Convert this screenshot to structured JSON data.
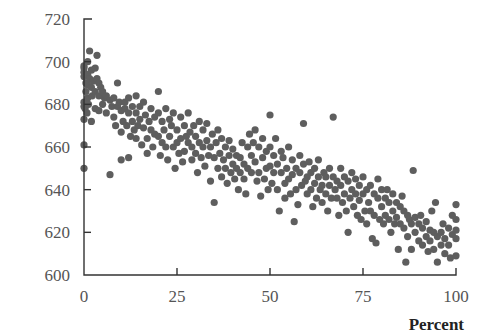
{
  "chart_data": {
    "type": "scatter",
    "title": "",
    "xlabel": "Percent",
    "ylabel": "",
    "xlim": [
      0,
      100
    ],
    "ylim": [
      600,
      720
    ],
    "xticks": [
      0,
      25,
      50,
      75,
      100
    ],
    "yticks": [
      600,
      620,
      640,
      660,
      680,
      700,
      720
    ],
    "grid": false,
    "legend": null,
    "marker_color": "#5e5e5e",
    "trend": "negative linear, approx y = 688 - 0.65x",
    "points": [
      [
        0,
        650
      ],
      [
        0,
        661
      ],
      [
        0,
        673
      ],
      [
        0,
        679
      ],
      [
        0,
        681
      ],
      [
        0,
        693
      ],
      [
        0,
        695
      ],
      [
        0,
        697
      ],
      [
        0,
        698
      ],
      [
        0.3,
        678
      ],
      [
        0.5,
        686
      ],
      [
        0.5,
        690
      ],
      [
        0.8,
        676
      ],
      [
        1,
        700
      ],
      [
        1,
        694
      ],
      [
        1,
        689
      ],
      [
        1,
        683
      ],
      [
        1.2,
        680
      ],
      [
        1.5,
        705
      ],
      [
        1.5,
        692
      ],
      [
        2,
        696
      ],
      [
        2,
        688
      ],
      [
        2,
        672
      ],
      [
        2.2,
        684
      ],
      [
        2.5,
        691
      ],
      [
        3,
        697
      ],
      [
        3,
        686
      ],
      [
        3,
        678
      ],
      [
        3.5,
        703
      ],
      [
        3.5,
        692
      ],
      [
        4,
        690
      ],
      [
        4,
        684
      ],
      [
        4,
        677
      ],
      [
        4.5,
        688
      ],
      [
        5,
        686
      ],
      [
        5,
        680
      ],
      [
        5.5,
        683
      ],
      [
        6,
        684
      ],
      [
        6,
        676
      ],
      [
        7,
        682
      ],
      [
        7,
        647
      ],
      [
        7.5,
        679
      ],
      [
        8,
        683
      ],
      [
        8,
        674
      ],
      [
        8.5,
        670
      ],
      [
        9,
        679
      ],
      [
        9,
        690
      ],
      [
        9.5,
        681
      ],
      [
        10,
        677
      ],
      [
        10,
        667
      ],
      [
        10,
        654
      ],
      [
        10.5,
        672
      ],
      [
        11,
        681
      ],
      [
        11,
        678
      ],
      [
        11.5,
        670
      ],
      [
        12,
        683
      ],
      [
        12,
        676
      ],
      [
        12,
        655
      ],
      [
        12.5,
        665
      ],
      [
        13,
        679
      ],
      [
        13,
        672
      ],
      [
        13.5,
        668
      ],
      [
        14,
        684
      ],
      [
        14,
        676
      ],
      [
        14,
        664
      ],
      [
        14.5,
        670
      ],
      [
        15,
        679
      ],
      [
        15,
        673
      ],
      [
        15.5,
        661
      ],
      [
        16,
        681
      ],
      [
        16,
        669
      ],
      [
        16.5,
        675
      ],
      [
        17,
        664
      ],
      [
        17,
        657
      ],
      [
        17.5,
        672
      ],
      [
        18,
        678
      ],
      [
        18,
        668
      ],
      [
        18.5,
        660
      ],
      [
        19,
        674
      ],
      [
        19,
        666
      ],
      [
        20,
        686
      ],
      [
        20,
        676
      ],
      [
        20,
        665
      ],
      [
        20.5,
        656
      ],
      [
        21,
        672
      ],
      [
        21,
        662
      ],
      [
        21.5,
        668
      ],
      [
        22,
        678
      ],
      [
        22,
        660
      ],
      [
        22.5,
        654
      ],
      [
        23,
        673
      ],
      [
        23,
        665
      ],
      [
        23.5,
        670
      ],
      [
        24,
        676
      ],
      [
        24,
        660
      ],
      [
        24.5,
        650
      ],
      [
        25,
        668
      ],
      [
        25,
        662
      ],
      [
        25.5,
        657
      ],
      [
        26,
        674
      ],
      [
        26,
        664
      ],
      [
        26.5,
        653
      ],
      [
        27,
        670
      ],
      [
        27,
        658
      ],
      [
        27.5,
        665
      ],
      [
        28,
        676
      ],
      [
        28,
        662
      ],
      [
        28.5,
        667
      ],
      [
        29,
        660
      ],
      [
        29,
        654
      ],
      [
        29.5,
        670
      ],
      [
        30,
        665
      ],
      [
        30,
        657
      ],
      [
        30.5,
        648
      ],
      [
        31,
        672
      ],
      [
        31,
        662
      ],
      [
        31.5,
        655
      ],
      [
        32,
        668
      ],
      [
        32,
        660
      ],
      [
        32.5,
        651
      ],
      [
        33,
        663
      ],
      [
        33,
        671
      ],
      [
        33.5,
        656
      ],
      [
        34,
        660
      ],
      [
        34,
        644
      ],
      [
        34.5,
        666
      ],
      [
        35,
        655
      ],
      [
        35,
        634
      ],
      [
        35.5,
        662
      ],
      [
        36,
        650
      ],
      [
        36,
        668
      ],
      [
        36.5,
        657
      ],
      [
        37,
        664
      ],
      [
        37,
        646
      ],
      [
        37.5,
        654
      ],
      [
        38,
        660
      ],
      [
        38,
        650
      ],
      [
        38.5,
        643
      ],
      [
        39,
        656
      ],
      [
        39,
        663
      ],
      [
        39.5,
        648
      ],
      [
        40,
        652
      ],
      [
        40,
        659
      ],
      [
        40.5,
        645
      ],
      [
        41,
        656
      ],
      [
        41,
        650
      ],
      [
        41.5,
        640
      ],
      [
        42,
        648
      ],
      [
        42,
        655
      ],
      [
        42.5,
        662
      ],
      [
        43,
        652
      ],
      [
        43,
        645
      ],
      [
        43.5,
        638
      ],
      [
        44,
        660
      ],
      [
        44,
        650
      ],
      [
        44.5,
        666
      ],
      [
        45,
        656
      ],
      [
        45,
        648
      ],
      [
        45.5,
        662
      ],
      [
        46,
        668
      ],
      [
        46,
        653
      ],
      [
        46.5,
        644
      ],
      [
        47,
        660
      ],
      [
        47,
        648
      ],
      [
        47.5,
        637
      ],
      [
        48,
        664
      ],
      [
        48,
        655
      ],
      [
        48.5,
        645
      ],
      [
        49,
        658
      ],
      [
        49,
        650
      ],
      [
        49.5,
        640
      ],
      [
        50,
        675
      ],
      [
        50,
        660
      ],
      [
        50,
        651
      ],
      [
        50.5,
        643
      ],
      [
        51,
        656
      ],
      [
        51,
        648
      ],
      [
        51.5,
        664
      ],
      [
        52,
        652
      ],
      [
        52,
        640
      ],
      [
        52.5,
        630
      ],
      [
        53,
        658
      ],
      [
        53,
        648
      ],
      [
        53.5,
        655
      ],
      [
        54,
        643
      ],
      [
        54,
        636
      ],
      [
        54.5,
        650
      ],
      [
        55,
        660
      ],
      [
        55,
        645
      ],
      [
        55.5,
        638
      ],
      [
        56,
        654
      ],
      [
        56,
        647
      ],
      [
        56.5,
        625
      ],
      [
        57,
        650
      ],
      [
        57,
        640
      ],
      [
        57.5,
        633
      ],
      [
        58,
        656
      ],
      [
        58,
        648
      ],
      [
        58.5,
        642
      ],
      [
        59,
        671
      ],
      [
        59,
        652
      ],
      [
        59.5,
        644
      ],
      [
        60,
        646
      ],
      [
        60,
        638
      ],
      [
        60.5,
        653
      ],
      [
        61,
        648
      ],
      [
        61,
        640
      ],
      [
        61.5,
        632
      ],
      [
        62,
        650
      ],
      [
        62,
        643
      ],
      [
        62.5,
        636
      ],
      [
        63,
        654
      ],
      [
        63,
        646
      ],
      [
        63.5,
        640
      ],
      [
        64,
        642
      ],
      [
        64,
        634
      ],
      [
        64.5,
        648
      ],
      [
        65,
        646
      ],
      [
        65,
        638
      ],
      [
        65.5,
        630
      ],
      [
        66,
        650
      ],
      [
        66,
        642
      ],
      [
        66.5,
        636
      ],
      [
        67,
        674
      ],
      [
        67,
        646
      ],
      [
        67.5,
        640
      ],
      [
        68,
        644
      ],
      [
        68,
        636
      ],
      [
        68.5,
        628
      ],
      [
        69,
        650
      ],
      [
        69,
        642
      ],
      [
        69.5,
        634
      ],
      [
        70,
        646
      ],
      [
        70,
        638
      ],
      [
        70.5,
        630
      ],
      [
        71,
        644
      ],
      [
        71,
        620
      ],
      [
        71.5,
        636
      ],
      [
        72,
        648
      ],
      [
        72,
        640
      ],
      [
        72.5,
        632
      ],
      [
        73,
        645
      ],
      [
        73,
        638
      ],
      [
        73.5,
        628
      ],
      [
        74,
        642
      ],
      [
        74,
        635
      ],
      [
        74.5,
        626
      ],
      [
        75,
        646
      ],
      [
        75,
        638
      ],
      [
        75.5,
        630
      ],
      [
        76,
        640
      ],
      [
        76,
        624
      ],
      [
        76.5,
        634
      ],
      [
        77,
        642
      ],
      [
        77,
        630
      ],
      [
        77.5,
        617
      ],
      [
        78,
        638
      ],
      [
        78,
        628
      ],
      [
        78.5,
        615
      ],
      [
        79,
        645
      ],
      [
        79,
        636
      ],
      [
        79.5,
        626
      ],
      [
        80,
        640
      ],
      [
        80,
        632
      ],
      [
        80.5,
        624
      ],
      [
        81,
        636
      ],
      [
        81,
        628
      ],
      [
        81.5,
        640
      ],
      [
        82,
        634
      ],
      [
        82,
        626
      ],
      [
        82.5,
        620
      ],
      [
        83,
        638
      ],
      [
        83,
        630
      ],
      [
        83.5,
        624
      ],
      [
        84,
        634
      ],
      [
        84,
        627
      ],
      [
        84.5,
        612
      ],
      [
        85,
        632
      ],
      [
        85,
        624
      ],
      [
        85.5,
        637
      ],
      [
        86,
        630
      ],
      [
        86,
        622
      ],
      [
        86.5,
        606
      ],
      [
        87,
        628
      ],
      [
        87,
        618
      ],
      [
        87.5,
        626
      ],
      [
        88,
        624
      ],
      [
        88,
        612
      ],
      [
        88.5,
        649
      ],
      [
        89,
        627
      ],
      [
        89,
        620
      ],
      [
        90,
        624
      ],
      [
        90,
        616
      ],
      [
        90.5,
        628
      ],
      [
        91,
        622
      ],
      [
        91,
        614
      ],
      [
        92,
        625
      ],
      [
        92,
        618
      ],
      [
        92.5,
        611
      ],
      [
        93,
        621
      ],
      [
        93,
        616
      ],
      [
        93.5,
        630
      ],
      [
        94,
        620
      ],
      [
        94,
        612
      ],
      [
        94.5,
        634
      ],
      [
        95,
        618
      ],
      [
        95,
        606
      ],
      [
        96,
        620
      ],
      [
        96,
        614
      ],
      [
        96.5,
        624
      ],
      [
        97,
        617
      ],
      [
        97,
        610
      ],
      [
        98,
        622
      ],
      [
        98,
        614
      ],
      [
        98.5,
        608
      ],
      [
        99,
        619
      ],
      [
        99,
        628
      ],
      [
        100,
        633
      ],
      [
        100,
        626
      ],
      [
        100,
        621
      ],
      [
        100,
        617
      ],
      [
        100,
        609
      ]
    ]
  },
  "axes": {
    "x_tick_labels": [
      "0",
      "25",
      "50",
      "75",
      "100"
    ],
    "y_tick_labels": [
      "600",
      "620",
      "640",
      "660",
      "680",
      "700",
      "720"
    ],
    "x_title": "Percent"
  }
}
